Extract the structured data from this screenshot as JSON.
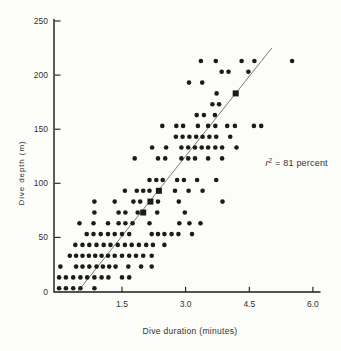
{
  "figure": {
    "background_color": "#fcfcf9",
    "ink_color": "#1b1b1b",
    "text_color": "#333331",
    "line_color": "#6b6b68"
  },
  "chart_data": {
    "type": "scatter",
    "title": "",
    "xlabel": "Dive duration (minutes)",
    "ylabel": "Dive depth  (m)",
    "xlim": [
      0,
      6.3
    ],
    "ylim": [
      0,
      250
    ],
    "grid": false,
    "x_ticks": [
      1.5,
      3.0,
      4.5,
      6.0
    ],
    "x_tick_labels": [
      "1.5",
      "3.0",
      "4.5",
      "6.0"
    ],
    "y_ticks": [
      0,
      50,
      100,
      150,
      200,
      250
    ],
    "y_tick_labels": [
      "0",
      "50",
      "100",
      "150",
      "200",
      "250"
    ],
    "annotation": {
      "r_symbol": "r",
      "superscript": "2",
      "rest": " = 81 percent",
      "x": 4.88,
      "y": 116
    },
    "regression_line": {
      "x1": 0.46,
      "y1": 0,
      "x2": 5.03,
      "y2": 225,
      "r_squared_percent": 81
    },
    "series": [
      {
        "name": "dive-observations",
        "marker": "circle",
        "points": [
          [
            0.02,
            0
          ],
          [
            0.18,
            0
          ],
          [
            0.35,
            0
          ],
          [
            0.52,
            0
          ],
          [
            0.85,
            0
          ],
          [
            0.02,
            10
          ],
          [
            0.18,
            10
          ],
          [
            0.35,
            10
          ],
          [
            0.52,
            10
          ],
          [
            0.68,
            10
          ],
          [
            0.85,
            10
          ],
          [
            1.02,
            10
          ],
          [
            1.18,
            10
          ],
          [
            1.5,
            10
          ],
          [
            1.67,
            10
          ],
          [
            0.05,
            20
          ],
          [
            0.42,
            20
          ],
          [
            0.57,
            20
          ],
          [
            0.73,
            20
          ],
          [
            0.9,
            20
          ],
          [
            1.05,
            20
          ],
          [
            1.2,
            20
          ],
          [
            1.35,
            20
          ],
          [
            1.65,
            20
          ],
          [
            1.95,
            20
          ],
          [
            2.2,
            20
          ],
          [
            0.27,
            30
          ],
          [
            0.42,
            30
          ],
          [
            0.57,
            30
          ],
          [
            0.72,
            30
          ],
          [
            0.87,
            30
          ],
          [
            1.02,
            30
          ],
          [
            1.17,
            30
          ],
          [
            1.33,
            30
          ],
          [
            1.5,
            30
          ],
          [
            1.67,
            30
          ],
          [
            1.83,
            30
          ],
          [
            2.0,
            30
          ],
          [
            2.2,
            30
          ],
          [
            0.4,
            40
          ],
          [
            0.57,
            40
          ],
          [
            0.73,
            40
          ],
          [
            0.9,
            40
          ],
          [
            1.07,
            40
          ],
          [
            1.23,
            40
          ],
          [
            1.4,
            40
          ],
          [
            1.57,
            40
          ],
          [
            1.73,
            40
          ],
          [
            1.9,
            40
          ],
          [
            2.07,
            40
          ],
          [
            2.23,
            40
          ],
          [
            2.5,
            40
          ],
          [
            0.67,
            50
          ],
          [
            0.83,
            50
          ],
          [
            1.0,
            50
          ],
          [
            1.17,
            50
          ],
          [
            1.33,
            50
          ],
          [
            1.5,
            50
          ],
          [
            1.67,
            50
          ],
          [
            2.2,
            50
          ],
          [
            2.35,
            50
          ],
          [
            2.5,
            50
          ],
          [
            2.67,
            50
          ],
          [
            2.83,
            50
          ],
          [
            3.15,
            50
          ],
          [
            0.5,
            60
          ],
          [
            0.83,
            60
          ],
          [
            1.17,
            60
          ],
          [
            1.42,
            60
          ],
          [
            1.58,
            60
          ],
          [
            1.75,
            60
          ],
          [
            2.15,
            60
          ],
          [
            2.85,
            60
          ],
          [
            3.09,
            60
          ],
          [
            3.35,
            60
          ],
          [
            0.85,
            70
          ],
          [
            1.42,
            70
          ],
          [
            1.58,
            70
          ],
          [
            1.87,
            70
          ],
          [
            2.33,
            70
          ],
          [
            2.98,
            70
          ],
          [
            0.85,
            80
          ],
          [
            1.33,
            80
          ],
          [
            1.77,
            80
          ],
          [
            1.93,
            80
          ],
          [
            2.35,
            80
          ],
          [
            2.84,
            80
          ],
          [
            3.87,
            80
          ],
          [
            1.57,
            90
          ],
          [
            1.85,
            90
          ],
          [
            2.0,
            90
          ],
          [
            2.15,
            90
          ],
          [
            2.75,
            90
          ],
          [
            3.07,
            90
          ],
          [
            3.4,
            90
          ],
          [
            2.15,
            100
          ],
          [
            2.31,
            100
          ],
          [
            2.46,
            100
          ],
          [
            2.8,
            100
          ],
          [
            2.96,
            100
          ],
          [
            3.27,
            100
          ],
          [
            3.72,
            100
          ],
          [
            1.8,
            120
          ],
          [
            2.35,
            120
          ],
          [
            2.52,
            120
          ],
          [
            2.9,
            120
          ],
          [
            3.06,
            120
          ],
          [
            3.22,
            120
          ],
          [
            3.53,
            120
          ],
          [
            3.86,
            120
          ],
          [
            2.21,
            130
          ],
          [
            2.54,
            130
          ],
          [
            2.9,
            130
          ],
          [
            3.06,
            130
          ],
          [
            3.22,
            130
          ],
          [
            3.38,
            130
          ],
          [
            3.53,
            130
          ],
          [
            3.7,
            130
          ],
          [
            3.86,
            130
          ],
          [
            4.2,
            130
          ],
          [
            2.77,
            140
          ],
          [
            2.93,
            140
          ],
          [
            3.09,
            140
          ],
          [
            3.25,
            140
          ],
          [
            3.4,
            140
          ],
          [
            3.56,
            140
          ],
          [
            3.72,
            140
          ],
          [
            4.05,
            140
          ],
          [
            2.45,
            150
          ],
          [
            2.78,
            150
          ],
          [
            2.94,
            150
          ],
          [
            3.29,
            150
          ],
          [
            3.53,
            150
          ],
          [
            3.7,
            150
          ],
          [
            3.98,
            150
          ],
          [
            4.16,
            150
          ],
          [
            4.61,
            150
          ],
          [
            4.78,
            150
          ],
          [
            3.26,
            160
          ],
          [
            3.43,
            160
          ],
          [
            3.69,
            160
          ],
          [
            3.63,
            170
          ],
          [
            3.79,
            170
          ],
          [
            3.73,
            180
          ],
          [
            3.08,
            190
          ],
          [
            3.39,
            190
          ],
          [
            3.85,
            200
          ],
          [
            4.01,
            200
          ],
          [
            4.48,
            200
          ],
          [
            3.36,
            210
          ],
          [
            3.71,
            210
          ],
          [
            4.32,
            210
          ],
          [
            4.62,
            210
          ],
          [
            5.51,
            210
          ]
        ]
      },
      {
        "name": "regression-line-markers",
        "marker": "square",
        "points": [
          [
            2.0,
            70
          ],
          [
            2.17,
            80
          ],
          [
            2.37,
            90
          ],
          [
            4.18,
            180
          ]
        ]
      }
    ]
  }
}
